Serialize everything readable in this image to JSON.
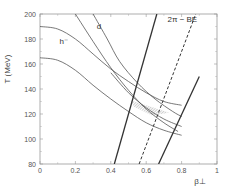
{
  "chart_data": {
    "type": "line",
    "title": "",
    "xlabel": "β⊥",
    "ylabel": "T (MeV)",
    "xlim": [
      0,
      1
    ],
    "ylim": [
      80,
      200
    ],
    "x_ticks": [
      "0",
      "0.2",
      "0.4",
      "0.6",
      "0.8",
      "1"
    ],
    "y_ticks": [
      "80",
      "100",
      "120",
      "140",
      "160",
      "180",
      "200"
    ],
    "grid": false,
    "annotations": [
      {
        "text": "h⁻",
        "x": 0.11,
        "y": 176
      },
      {
        "text": "d",
        "x": 0.32,
        "y": 188
      },
      {
        "text": "2π − BE",
        "x": 0.72,
        "y": 194
      }
    ],
    "series": [
      {
        "name": "h- upper",
        "style": "solid",
        "points": [
          [
            0,
            190
          ],
          [
            0.1,
            188
          ],
          [
            0.2,
            180
          ],
          [
            0.3,
            168
          ],
          [
            0.4,
            156
          ],
          [
            0.5,
            146
          ],
          [
            0.6,
            137
          ],
          [
            0.7,
            130
          ],
          [
            0.8,
            127
          ]
        ]
      },
      {
        "name": "h- middle",
        "style": "solid",
        "points": [
          [
            0.4,
            153
          ],
          [
            0.5,
            137
          ],
          [
            0.6,
            125
          ],
          [
            0.7,
            116
          ],
          [
            0.8,
            110
          ]
        ]
      },
      {
        "name": "h- lower",
        "style": "solid",
        "points": [
          [
            0,
            165
          ],
          [
            0.1,
            163
          ],
          [
            0.2,
            155
          ],
          [
            0.3,
            143
          ],
          [
            0.4,
            132
          ],
          [
            0.5,
            122
          ],
          [
            0.6,
            113
          ],
          [
            0.7,
            107
          ],
          [
            0.8,
            103
          ]
        ]
      },
      {
        "name": "d left",
        "style": "solid",
        "points": [
          [
            0.2,
            200
          ],
          [
            0.3,
            178
          ],
          [
            0.4,
            157
          ],
          [
            0.5,
            139
          ],
          [
            0.6,
            124
          ],
          [
            0.7,
            113
          ],
          [
            0.78,
            106
          ]
        ]
      },
      {
        "name": "d right",
        "style": "solid",
        "points": [
          [
            0.3,
            200
          ],
          [
            0.38,
            180
          ],
          [
            0.45,
            162
          ],
          [
            0.55,
            145
          ],
          [
            0.65,
            132
          ],
          [
            0.75,
            122
          ],
          [
            0.8,
            118
          ]
        ]
      },
      {
        "name": "2π-BE left bound",
        "style": "solid-thick",
        "points": [
          [
            0.42,
            80
          ],
          [
            0.66,
            200
          ]
        ]
      },
      {
        "name": "2π-BE",
        "style": "dashed",
        "points": [
          [
            0.56,
            80
          ],
          [
            0.88,
            200
          ]
        ]
      },
      {
        "name": "2π-BE right bound",
        "style": "solid-thick",
        "points": [
          [
            0.67,
            80
          ],
          [
            0.9,
            150
          ]
        ]
      }
    ],
    "shaded_region": {
      "description": "hatched overlap region",
      "polygon": [
        [
          0.51,
          131
        ],
        [
          0.6,
          127
        ],
        [
          0.73,
          121
        ],
        [
          0.63,
          119
        ],
        [
          0.53,
          126
        ]
      ]
    }
  }
}
